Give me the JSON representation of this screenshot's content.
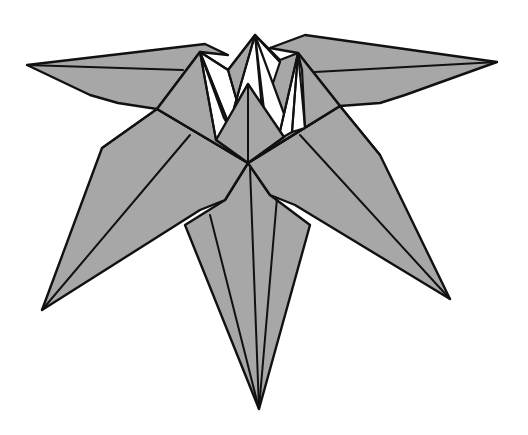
{
  "diagram": {
    "colors": {
      "paper_colored_side": "#a7a7a7",
      "paper_white_side": "#ffffff",
      "line": "#111111",
      "background": "#ffffff"
    },
    "parts": [
      {
        "name": "left-upper-petal",
        "tip": [
          27,
          65
        ]
      },
      {
        "name": "right-upper-petal",
        "tip": [
          497,
          62
        ]
      },
      {
        "name": "left-lower-petal",
        "tip": [
          42,
          310
        ]
      },
      {
        "name": "right-lower-petal",
        "tip": [
          450,
          299
        ]
      },
      {
        "name": "bottom-petal",
        "tip": [
          259,
          409
        ]
      },
      {
        "name": "center-top-peak",
        "tip": [
          255,
          35
        ]
      },
      {
        "name": "center-front-peak",
        "tip": [
          248,
          84
        ]
      },
      {
        "name": "center-junction",
        "point": [
          248,
          163
        ]
      }
    ]
  }
}
